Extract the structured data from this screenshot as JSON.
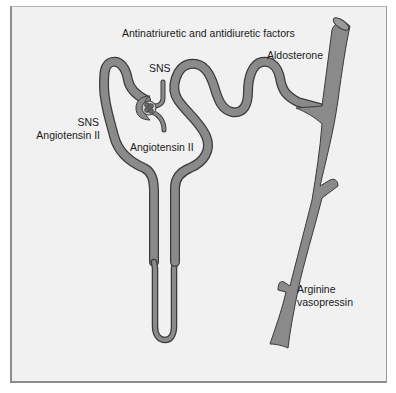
{
  "figure": {
    "title": "Antinatriuretic and antidiuretic factors",
    "colors": {
      "background": "#f1f1f1",
      "tubule_fill": "#8a8a8a",
      "tubule_outline": "#3a3a3a",
      "text": "#1a1a1a"
    },
    "structures": [
      "glomerulus",
      "proximal-tubule",
      "loop-of-henle",
      "distal-tubule",
      "collecting-duct"
    ],
    "labels": {
      "sns_top": "SNS",
      "sns_left": "SNS",
      "angiotensin_left": "Angiotensin II",
      "angiotensin_center": "Angiotensin II",
      "aldosterone": "Aldosterone",
      "avp_line1": "Arginine",
      "avp_line2": "vasopressin"
    }
  }
}
